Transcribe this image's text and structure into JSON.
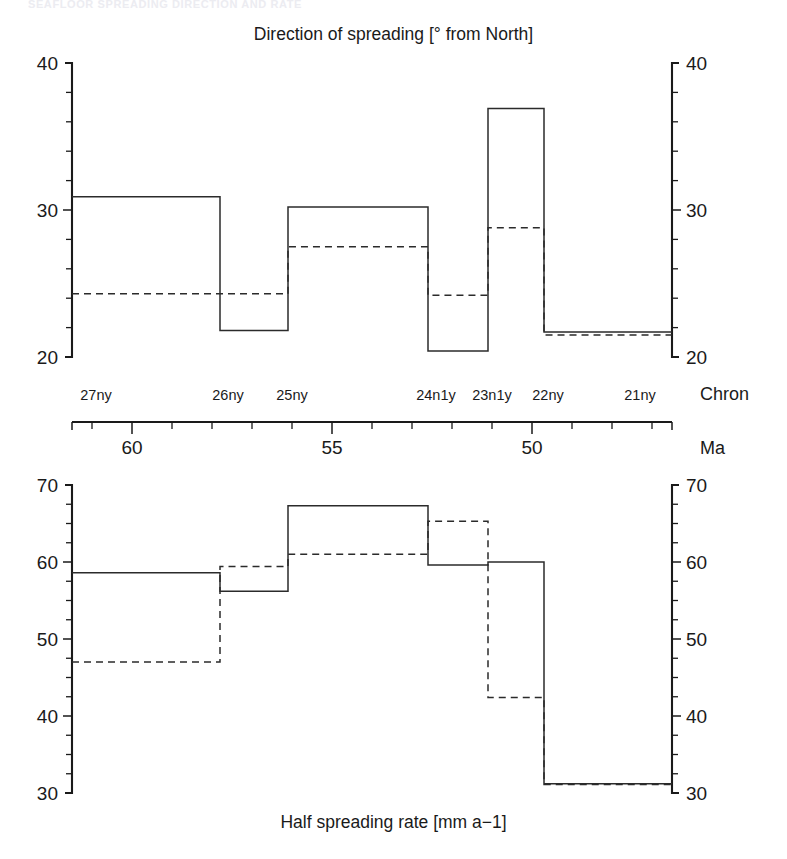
{
  "figure": {
    "running_header": "SEAFLOOR SPREADING DIRECTION AND RATE",
    "background": "#ffffff",
    "ink_color": "#1a1a1a"
  },
  "top_panel": {
    "title": "Direction of spreading [° from North]",
    "y_label_top": "40",
    "y_label_mid": "30",
    "y_label_bottom": "20"
  },
  "bottom_panel": {
    "title": "Half spreading rate [mm a−1]",
    "y_label_top": "70",
    "y_label_60": "60",
    "y_label_50": "50",
    "y_label_40": "40",
    "y_label_bottom": "30"
  },
  "time_axis": {
    "chron_axis_name": "Chron",
    "age_axis_name": "Ma",
    "age_ticks": [
      60,
      55,
      50
    ],
    "age_tick_labels": [
      "60",
      "55",
      "50"
    ],
    "age_range": [
      61.5,
      46.5
    ],
    "age_minor_step": 1,
    "chrons": [
      {
        "label": "27ny",
        "age": 60.9
      },
      {
        "label": "26ny",
        "age": 57.6
      },
      {
        "label": "25ny",
        "age": 56.0
      },
      {
        "label": "24n1y",
        "age": 52.4
      },
      {
        "label": "23n1y",
        "age": 51.0
      },
      {
        "label": "22ny",
        "age": 49.6
      },
      {
        "label": "21ny",
        "age": 47.3
      }
    ]
  },
  "chart_data": [
    {
      "type": "line",
      "subtype": "step",
      "title": "Direction of spreading [° from North]",
      "xlabel": "Ma",
      "ylabel": "Direction of spreading [° from North]",
      "ylim": [
        20,
        40
      ],
      "xlim": [
        61.5,
        46.5
      ],
      "ytick_major": [
        20,
        30,
        40
      ],
      "ytick_minor_step": 2,
      "grid": false,
      "legend": "none",
      "x_edges": [
        61.5,
        57.8,
        56.1,
        52.6,
        51.1,
        49.7,
        46.5
      ],
      "series": [
        {
          "name": "solid",
          "style": "solid",
          "values": [
            30.9,
            21.8,
            30.2,
            20.4,
            36.9,
            21.7
          ]
        },
        {
          "name": "dashed",
          "style": "dashed",
          "values": [
            24.3,
            24.3,
            27.5,
            24.2,
            28.8,
            21.5
          ]
        }
      ]
    },
    {
      "type": "line",
      "subtype": "step",
      "title": "Half spreading rate [mm a−1]",
      "xlabel": "Ma",
      "ylabel": "Half spreading rate [mm a−1]",
      "ylim": [
        30,
        70
      ],
      "xlim": [
        61.5,
        46.5
      ],
      "ytick_major": [
        30,
        40,
        50,
        60,
        70
      ],
      "ytick_minor_step": 2.5,
      "grid": false,
      "legend": "none",
      "x_edges": [
        61.5,
        57.8,
        56.1,
        52.6,
        51.1,
        49.7,
        46.5
      ],
      "series": [
        {
          "name": "solid",
          "style": "solid",
          "values": [
            58.6,
            56.2,
            67.3,
            59.6,
            60.0,
            31.2
          ]
        },
        {
          "name": "dashed",
          "style": "dashed",
          "values": [
            47.0,
            59.4,
            61.0,
            65.3,
            42.4,
            31.1
          ]
        }
      ]
    }
  ]
}
